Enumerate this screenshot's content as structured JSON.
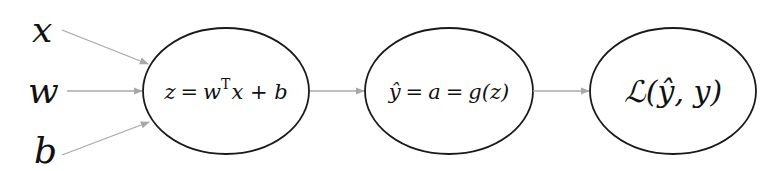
{
  "diagram": {
    "type": "computation-graph",
    "colors": {
      "node_stroke": "#1a1a1a",
      "edge": "#a8a8a8",
      "text": "#111111",
      "background": "#ffffff"
    },
    "inputs": [
      {
        "id": "x",
        "label": "x"
      },
      {
        "id": "w",
        "label": "w"
      },
      {
        "id": "b",
        "label": "b"
      }
    ],
    "nodes": [
      {
        "id": "linear",
        "formula": {
          "lhs": "z",
          "eq": "=",
          "w": "w",
          "sup": "T",
          "rest": "x + b"
        }
      },
      {
        "id": "activation",
        "formula": {
          "yhat": "ŷ",
          "eq1": "=",
          "a": "a",
          "eq2": "=",
          "g": "g(z)"
        }
      },
      {
        "id": "loss",
        "formula": {
          "L": "ℒ",
          "args": "(ŷ, y)"
        }
      }
    ],
    "edges": [
      {
        "from": "x",
        "to": "linear"
      },
      {
        "from": "w",
        "to": "linear"
      },
      {
        "from": "b",
        "to": "linear"
      },
      {
        "from": "linear",
        "to": "activation"
      },
      {
        "from": "activation",
        "to": "loss"
      }
    ]
  }
}
